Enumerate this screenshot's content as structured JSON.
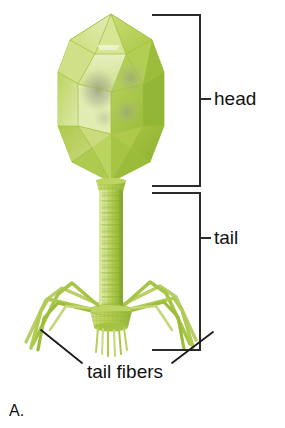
{
  "figure": {
    "panel_letter": "A.",
    "background_color": "#ffffff",
    "width": 285,
    "height": 428
  },
  "labels": {
    "head": "head",
    "tail": "tail",
    "tail_fibers": "tail fibers"
  },
  "annotations": {
    "bracket_color": "#2b2b2b",
    "leader_color": "#1a1a1a",
    "head_bracket": {
      "top_y": 15,
      "bottom_y": 186,
      "left_x": 152,
      "spine_x": 200,
      "tick_y": 99
    },
    "tail_bracket": {
      "top_y": 193,
      "bottom_y": 350,
      "left_x": 152,
      "spine_x": 200,
      "tick_y": 238
    },
    "tail_fiber_leaders": [
      {
        "from_x": 82,
        "from_y": 363,
        "to_x": 41,
        "to_y": 330
      },
      {
        "from_x": 172,
        "from_y": 363,
        "to_x": 213,
        "to_y": 332
      }
    ]
  },
  "organism": {
    "parts": [
      {
        "name": "head",
        "shape": "icosahedral capsid",
        "center_x": 111,
        "top_y": 14,
        "bottom_y": 182,
        "half_width": 53
      },
      {
        "name": "collar",
        "center_x": 111,
        "y": 184
      },
      {
        "name": "tail",
        "shape": "helical contractile sheath tube",
        "center_x": 111,
        "top_y": 190,
        "bottom_y": 312,
        "half_width": 12
      },
      {
        "name": "baseplate",
        "center_x": 111,
        "y": 318,
        "half_width": 20
      },
      {
        "name": "tail_pins",
        "count": 6,
        "top_y": 326,
        "bottom_y": 348
      },
      {
        "name": "tail_fibers",
        "count": 6,
        "description": "jointed legs radiating left and right from baseplate"
      }
    ],
    "colors": {
      "capsid_light": "#e2ecb4",
      "capsid_mid": "#c3d86a",
      "capsid_base": "#b3cf53",
      "capsid_dark": "#9dbd3c",
      "capsid_darker": "#8eae33",
      "capsid_edge": "#a6c341",
      "dna_smudge": "#9aa08a",
      "tail_light": "#d2e08a",
      "tail_mid": "#b9d25c",
      "tail_dark": "#93b537",
      "fiber": "#aac84b",
      "fiber_dark": "#8fb133"
    }
  }
}
